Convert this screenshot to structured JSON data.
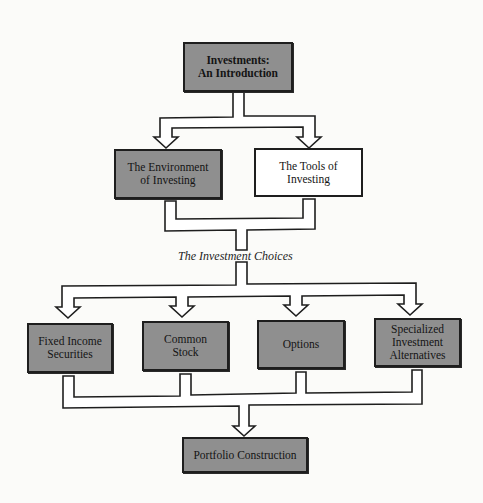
{
  "diagram": {
    "top": {
      "label": "Investments:\nAn Introduction"
    },
    "level2": [
      {
        "label": "The Environment\nof Investing",
        "style": "shaded"
      },
      {
        "label": "The Tools of\nInvesting",
        "style": "unshaded"
      }
    ],
    "caption": "The Investment Choices",
    "choices": [
      {
        "label": "Fixed Income\nSecurities"
      },
      {
        "label": "Common\nStock"
      },
      {
        "label": "Options"
      },
      {
        "label": "Specialized\nInvestment\nAlternatives"
      }
    ],
    "bottom": {
      "label": "Portfolio Construction"
    }
  },
  "colors": {
    "shaded_fill": "#8f8f8f",
    "unshaded_fill": "#ffffff",
    "outline": "#1e1e1e",
    "background": "#fbfbf9"
  }
}
